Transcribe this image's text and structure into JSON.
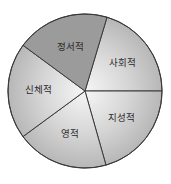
{
  "chart_data": {
    "type": "pie",
    "title": "",
    "legend": "none (labels inside slices)",
    "start_angle_deg": -73.4,
    "direction": "clockwise",
    "slices": [
      {
        "label": "사회적",
        "value": 20,
        "angle_deg": 73.4,
        "fill": "gradient",
        "highlighted": false
      },
      {
        "label": "지성적",
        "value": 20,
        "angle_deg": 74.2,
        "fill": "gradient",
        "highlighted": false
      },
      {
        "label": "영적",
        "value": 20,
        "angle_deg": 69.5,
        "fill": "gradient",
        "highlighted": false
      },
      {
        "label": "신체적",
        "value": 20,
        "angle_deg": 72.7,
        "fill": "gradient",
        "highlighted": false
      },
      {
        "label": "정서적",
        "value": 20,
        "angle_deg": 70.2,
        "fill": "#9b9b9b",
        "highlighted": true
      }
    ],
    "colors": {
      "highlight": "#9b9b9b",
      "gradient_center": "#f4f4f4",
      "gradient_edge": "#b9b9b9",
      "stroke": "#3a3a3a"
    }
  }
}
